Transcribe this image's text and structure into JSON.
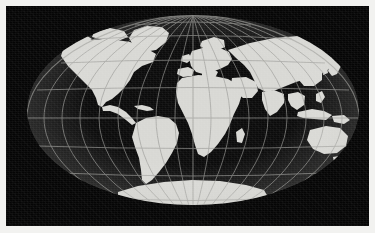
{
  "image": {
    "kind": "world-map-photograph",
    "subject": "World map on elliptical projection",
    "projection": "Mollweide / Hammer equal-area ellipse",
    "alt_text": "Grayscale world map in an elliptical projection showing all continents in light grey on a black background, overlaid with a latitude and longitude graticule.",
    "background_color": "#050505",
    "land_color": "#d8d8d4",
    "graticule_color": "#9a9a96",
    "border_color": "#f2f2f0",
    "halo_color": "#969696",
    "caption": ""
  },
  "map": {
    "center_longitude_deg": 0,
    "center_latitude_deg": 0,
    "ellipse": {
      "cx": 187,
      "cy": 104,
      "rx": 166,
      "ry": 95
    },
    "graticule": {
      "meridian_interval_deg": 20,
      "parallel_interval_deg": 20,
      "meridians_count": 17,
      "parallels_count": 9,
      "equator_latitude_deg": 0,
      "prime_meridian_longitude_deg": 0,
      "line_color": "#9a9a96"
    },
    "landmasses": [
      {
        "name": "North America"
      },
      {
        "name": "South America"
      },
      {
        "name": "Greenland"
      },
      {
        "name": "Europe"
      },
      {
        "name": "Africa"
      },
      {
        "name": "Asia"
      },
      {
        "name": "Australia"
      },
      {
        "name": "Antarctica"
      },
      {
        "name": "Madagascar"
      },
      {
        "name": "Japan"
      },
      {
        "name": "Indonesia"
      },
      {
        "name": "British Isles"
      },
      {
        "name": "New Zealand"
      }
    ],
    "oceans": [
      {
        "name": "Pacific Ocean"
      },
      {
        "name": "Atlantic Ocean"
      },
      {
        "name": "Indian Ocean"
      },
      {
        "name": "Arctic Ocean"
      },
      {
        "name": "Southern Ocean"
      }
    ]
  }
}
